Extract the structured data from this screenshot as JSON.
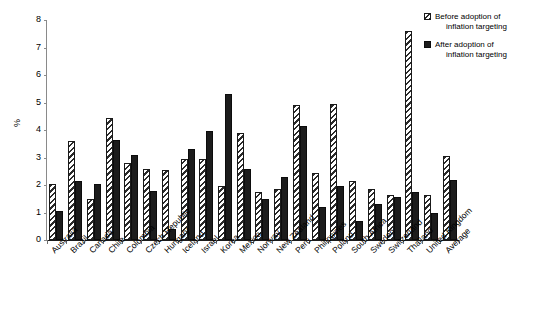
{
  "chart_data": {
    "type": "bar",
    "title": "",
    "subtitle": "",
    "xlabel": "",
    "ylabel": "%",
    "ylim": [
      0,
      8
    ],
    "yticks": [
      0,
      1,
      2,
      3,
      4,
      5,
      6,
      7,
      8
    ],
    "ytick_labels": [
      "0",
      "1",
      "2",
      "3",
      "4",
      "5",
      "6",
      "7",
      "8"
    ],
    "grid": false,
    "legend_position": "top-right",
    "categories": [
      "Australia",
      "Brazil",
      "Canada",
      "Chile",
      "Colombia",
      "Czech Republic",
      "Hungary",
      "Iceland",
      "Israel",
      "Korea",
      "Mexico",
      "Norway",
      "New Zealand",
      "Peru",
      "Philippines",
      "Poland",
      "South Africa",
      "Sweden",
      "Switzerland",
      "Thailand",
      "United Kingdom",
      "Average"
    ],
    "series": [
      {
        "name": "Before adoption of inflation targeting",
        "style": "hatched",
        "color": "#ffffff",
        "edge_color": "#1a1a1a",
        "values": [
          2.05,
          3.6,
          1.5,
          4.45,
          2.8,
          2.6,
          2.55,
          2.95,
          2.95,
          1.95,
          3.9,
          1.75,
          1.85,
          4.9,
          2.45,
          4.95,
          2.15,
          1.85,
          1.65,
          7.6,
          1.65,
          3.05
        ]
      },
      {
        "name": "After adoption of inflation targeting",
        "style": "solid",
        "color": "#1c1c1c",
        "edge_color": "#0c0c0c",
        "values": [
          1.05,
          2.15,
          2.05,
          3.65,
          3.1,
          1.8,
          0.4,
          3.3,
          3.95,
          5.3,
          2.6,
          1.5,
          2.3,
          4.15,
          1.2,
          1.95,
          0.7,
          1.3,
          1.55,
          1.75,
          1.0,
          2.2
        ]
      }
    ]
  },
  "legend": {
    "items": [
      {
        "line1": "Before adoption of",
        "line2": "inflation targeting",
        "swatch": "hatched-swatch"
      },
      {
        "line1": "After adoption of",
        "line2": "inflation targeting",
        "swatch": "solid-swatch"
      }
    ]
  }
}
